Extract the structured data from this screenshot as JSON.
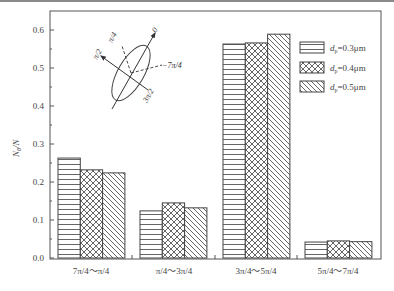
{
  "chart_data": {
    "type": "bar",
    "title": "",
    "xlabel": "",
    "ylabel": "Nθ/N",
    "ylim": [
      0.0,
      0.6
    ],
    "yticks": [
      "0.0",
      "0.1",
      "0.2",
      "0.3",
      "0.4",
      "0.5",
      "0.6"
    ],
    "grid": false,
    "legend_position": "upper right",
    "categories": [
      "7π/4～π/4",
      "π/4～3π/4",
      "3π/4～5π/4",
      "5π/4～7π/4"
    ],
    "series": [
      {
        "name": "dp=0.3μm",
        "pattern": "horizontal-lines",
        "values": [
          0.263,
          0.124,
          0.563,
          0.042
        ]
      },
      {
        "name": "dp=0.4μm",
        "pattern": "crosshatch",
        "values": [
          0.232,
          0.145,
          0.566,
          0.045
        ]
      },
      {
        "name": "dp=0.5μm",
        "pattern": "diagonal-lines",
        "values": [
          0.224,
          0.132,
          0.589,
          0.043
        ]
      }
    ],
    "annotations": {
      "inset_diagram": "ellipse with angle directions",
      "labels": [
        "0",
        "π/4",
        "π/2",
        "3π/2",
        "−7π/4"
      ]
    }
  },
  "axis": {
    "ylabel_main": "N",
    "ylabel_sub": "θ",
    "ylabel_tail": "/N"
  },
  "legend": [
    {
      "prefix": "d",
      "sub": "p",
      "suffix": "=0.3μm"
    },
    {
      "prefix": "d",
      "sub": "p",
      "suffix": "=0.4μm"
    },
    {
      "prefix": "d",
      "sub": "p",
      "suffix": "=0.5μm"
    }
  ],
  "diagram": {
    "zero": "0",
    "pi4": "π/4",
    "pi2": "π/2",
    "threepi2": "3π/2",
    "minus7pi4": "−7π/4"
  },
  "colors": {
    "frame": "#555555",
    "bar_stroke": "#444444",
    "fill": "#ffffff"
  }
}
